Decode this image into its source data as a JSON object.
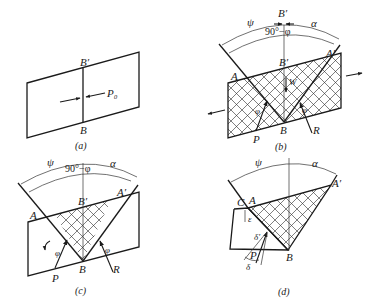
{
  "panels": {
    "a": {
      "caption": "(a)",
      "labels": {
        "top": "B′",
        "bottom": "B",
        "force": "P₀"
      }
    },
    "b": {
      "caption": "(b)",
      "labels": {
        "psi": "ψ",
        "alpha": "α",
        "top_b": "B′",
        "angle": "90°−φ",
        "mid_b": "B′",
        "A": "A",
        "A_prime": "A′",
        "W": "W",
        "phi_left": "φ",
        "phi_right": "φ",
        "B": "B",
        "P": "P",
        "R": "R"
      }
    },
    "c": {
      "caption": "(c)",
      "labels": {
        "psi": "ψ",
        "alpha": "α",
        "angle": "90°−φ",
        "mid_b": "B′",
        "A": "A",
        "A_prime": "A′",
        "phi_left": "φ",
        "phi_right": "φ",
        "B": "B",
        "P": "P",
        "R": "R"
      }
    },
    "d": {
      "caption": "(d)",
      "labels": {
        "psi": "ψ",
        "alpha": "α",
        "C": "C",
        "A": "A",
        "A_prime": "A′",
        "epsilon": "ε",
        "delta_prime": "δ′",
        "P": "P",
        "delta": "δ",
        "B": "B"
      }
    }
  }
}
